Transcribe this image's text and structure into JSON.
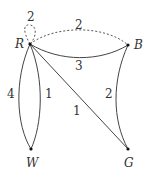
{
  "graph": {
    "vertices": [
      {
        "id": "R",
        "label": "R"
      },
      {
        "id": "B",
        "label": "B"
      },
      {
        "id": "W",
        "label": "W"
      },
      {
        "id": "G",
        "label": "G"
      }
    ],
    "edges": [
      {
        "from": "R",
        "to": "R",
        "weight": "2",
        "style": "dashed",
        "type": "loop"
      },
      {
        "from": "R",
        "to": "B",
        "weight": "2",
        "style": "dashed"
      },
      {
        "from": "R",
        "to": "B",
        "weight": "3",
        "style": "solid"
      },
      {
        "from": "R",
        "to": "W",
        "weight": "4",
        "style": "solid"
      },
      {
        "from": "R",
        "to": "W",
        "weight": "1",
        "style": "solid"
      },
      {
        "from": "R",
        "to": "G",
        "weight": "1",
        "style": "solid"
      },
      {
        "from": "B",
        "to": "G",
        "weight": "2",
        "style": "solid"
      }
    ]
  }
}
